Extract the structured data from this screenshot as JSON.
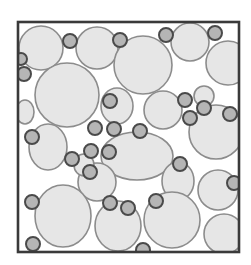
{
  "figure": {
    "caption": "",
    "canvas": {
      "width": 251,
      "height": 265
    },
    "background_color": "#ffffff"
  },
  "frame": {
    "name": "specimen-boundary",
    "x": 18,
    "y": 22,
    "width": 221,
    "height": 230,
    "stroke_color": "#3a3a3a",
    "stroke_width": 2.6,
    "fill_color": "#ffffff"
  },
  "style": {
    "coarse_fill": "#e6e6e6",
    "coarse_stroke": "#8c8c8c",
    "coarse_stroke_width": 1.6,
    "fine_fill": "#b5b5b5",
    "fine_stroke": "#4a4a4a",
    "fine_stroke_width": 2.0
  },
  "chart_data": {
    "type": "scatter",
    "xlabel": "",
    "ylabel": "",
    "xlim": [
      18,
      239
    ],
    "ylim": [
      22,
      252
    ],
    "grid": false,
    "legend": "none",
    "units": "pixels",
    "series": [
      {
        "name": "Coarse aggregate",
        "fill": "#e6e6e6",
        "stroke": "#8c8c8c",
        "count": 21,
        "particles": [
          {
            "id": "c1",
            "cx": 41,
            "cy": 48,
            "rx": 22,
            "ry": 22,
            "rot": 0
          },
          {
            "id": "c2",
            "cx": 97,
            "cy": 48,
            "rx": 21,
            "ry": 21,
            "rot": 0
          },
          {
            "id": "c3",
            "cx": 143,
            "cy": 65,
            "rx": 29,
            "ry": 29,
            "rot": 0
          },
          {
            "id": "c4",
            "cx": 190,
            "cy": 42,
            "rx": 19,
            "ry": 19,
            "rot": 0
          },
          {
            "id": "c5",
            "cx": 228,
            "cy": 63,
            "rx": 22,
            "ry": 22,
            "rot": 0
          },
          {
            "id": "c6",
            "cx": 67,
            "cy": 95,
            "rx": 32,
            "ry": 32,
            "rot": 0
          },
          {
            "id": "c7",
            "cx": 117,
            "cy": 106,
            "rx": 16,
            "ry": 18,
            "rot": 0
          },
          {
            "id": "c8",
            "cx": 163,
            "cy": 110,
            "rx": 19,
            "ry": 19,
            "rot": 0
          },
          {
            "id": "c9",
            "cx": 216,
            "cy": 132,
            "rx": 27,
            "ry": 27,
            "rot": 0
          },
          {
            "id": "c10",
            "cx": 48,
            "cy": 147,
            "rx": 19,
            "ry": 23,
            "rot": 0
          },
          {
            "id": "c11",
            "cx": 137,
            "cy": 156,
            "rx": 36,
            "ry": 24,
            "rot": 0
          },
          {
            "id": "c12",
            "cx": 97,
            "cy": 182,
            "rx": 19,
            "ry": 19,
            "rot": 0
          },
          {
            "id": "c13",
            "cx": 178,
            "cy": 181,
            "rx": 16,
            "ry": 19,
            "rot": 0
          },
          {
            "id": "c14",
            "cx": 218,
            "cy": 190,
            "rx": 20,
            "ry": 20,
            "rot": 0
          },
          {
            "id": "c15",
            "cx": 63,
            "cy": 216,
            "rx": 28,
            "ry": 31,
            "rot": 0
          },
          {
            "id": "c16",
            "cx": 118,
            "cy": 226,
            "rx": 23,
            "ry": 25,
            "rot": 0
          },
          {
            "id": "c17",
            "cx": 172,
            "cy": 220,
            "rx": 28,
            "ry": 28,
            "rot": 0
          },
          {
            "id": "c18",
            "cx": 224,
            "cy": 234,
            "rx": 20,
            "ry": 20,
            "rot": 0
          },
          {
            "id": "c19",
            "cx": 25,
            "cy": 112,
            "rx": 9,
            "ry": 12,
            "rot": 0
          },
          {
            "id": "c20",
            "cx": 84,
            "cy": 165,
            "rx": 10,
            "ry": 11,
            "rot": 0
          },
          {
            "id": "c21",
            "cx": 204,
            "cy": 96,
            "rx": 10,
            "ry": 10,
            "rot": 0
          }
        ]
      },
      {
        "name": "Fine aggregate",
        "fill": "#b5b5b5",
        "stroke": "#4a4a4a",
        "count": 27,
        "particles": [
          {
            "id": "f1",
            "cx": 70,
            "cy": 41,
            "r": 7
          },
          {
            "id": "f2",
            "cx": 120,
            "cy": 40,
            "r": 7
          },
          {
            "id": "f3",
            "cx": 166,
            "cy": 35,
            "r": 7
          },
          {
            "id": "f4",
            "cx": 215,
            "cy": 33,
            "r": 7
          },
          {
            "id": "f5",
            "cx": 24,
            "cy": 74,
            "r": 7
          },
          {
            "id": "f6",
            "cx": 110,
            "cy": 101,
            "r": 7
          },
          {
            "id": "f7",
            "cx": 185,
            "cy": 100,
            "r": 7
          },
          {
            "id": "f8",
            "cx": 204,
            "cy": 108,
            "r": 7
          },
          {
            "id": "f9",
            "cx": 190,
            "cy": 118,
            "r": 7
          },
          {
            "id": "f10",
            "cx": 230,
            "cy": 114,
            "r": 7
          },
          {
            "id": "f11",
            "cx": 32,
            "cy": 137,
            "r": 7
          },
          {
            "id": "f12",
            "cx": 140,
            "cy": 131,
            "r": 7
          },
          {
            "id": "f13",
            "cx": 72,
            "cy": 159,
            "r": 7
          },
          {
            "id": "f14",
            "cx": 91,
            "cy": 151,
            "r": 7
          },
          {
            "id": "f15",
            "cx": 109,
            "cy": 152,
            "r": 7
          },
          {
            "id": "f16",
            "cx": 90,
            "cy": 172,
            "r": 7
          },
          {
            "id": "f17",
            "cx": 180,
            "cy": 164,
            "r": 7
          },
          {
            "id": "f18",
            "cx": 234,
            "cy": 183,
            "r": 7
          },
          {
            "id": "f19",
            "cx": 32,
            "cy": 202,
            "r": 7
          },
          {
            "id": "f20",
            "cx": 110,
            "cy": 203,
            "r": 7
          },
          {
            "id": "f21",
            "cx": 128,
            "cy": 208,
            "r": 7
          },
          {
            "id": "f22",
            "cx": 156,
            "cy": 201,
            "r": 7
          },
          {
            "id": "f23",
            "cx": 33,
            "cy": 244,
            "r": 7
          },
          {
            "id": "f24",
            "cx": 143,
            "cy": 250,
            "r": 7
          },
          {
            "id": "f25",
            "cx": 21,
            "cy": 59,
            "r": 6
          },
          {
            "id": "f26",
            "cx": 95,
            "cy": 128,
            "r": 7
          },
          {
            "id": "f27",
            "cx": 114,
            "cy": 129,
            "r": 7
          }
        ]
      }
    ]
  }
}
